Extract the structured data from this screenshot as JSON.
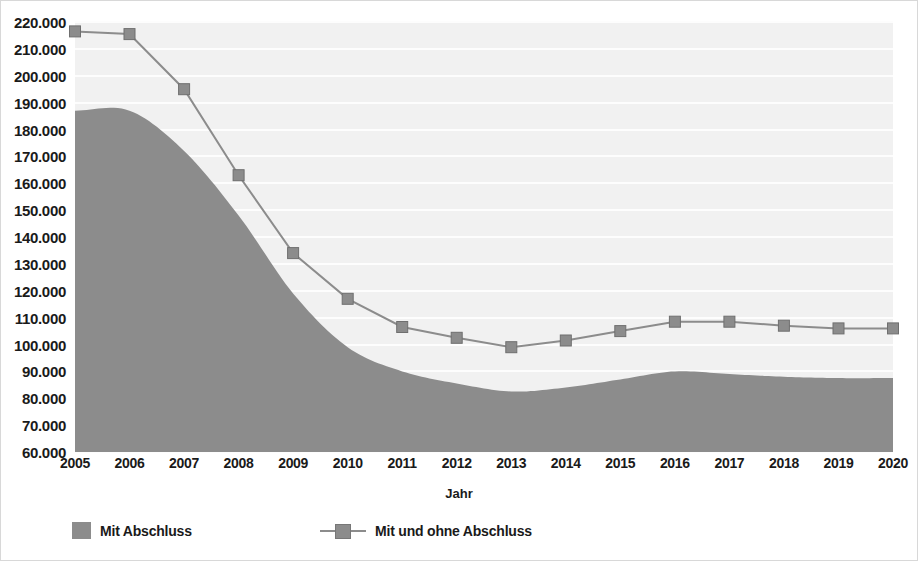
{
  "chart_data": {
    "type": "area",
    "title": "",
    "xlabel": "Jahr",
    "ylabel": "",
    "categories": [
      "2005",
      "2006",
      "2007",
      "2008",
      "2009",
      "2010",
      "2011",
      "2012",
      "2013",
      "2014",
      "2015",
      "2016",
      "2017",
      "2018",
      "2019",
      "2020"
    ],
    "ylim": [
      60000,
      220000
    ],
    "ytick_step": 10000,
    "ytick_labels": [
      "220.000",
      "210.000",
      "200.000",
      "190.000",
      "180.000",
      "170.000",
      "160.000",
      "150.000",
      "140.000",
      "130.000",
      "120.000",
      "110.000",
      "100.000",
      "90.000",
      "80.000",
      "70.000",
      "60.000"
    ],
    "ytick_values": [
      220000,
      210000,
      200000,
      190000,
      180000,
      170000,
      160000,
      150000,
      140000,
      130000,
      120000,
      110000,
      100000,
      90000,
      80000,
      70000,
      60000
    ],
    "grid": true,
    "legend_position": "bottom",
    "series": [
      {
        "name": "Mit Abschluss",
        "type": "area",
        "color": "#8c8c8c",
        "values": [
          187000,
          187000,
          172000,
          148000,
          119000,
          99000,
          90000,
          85500,
          82500,
          84000,
          87000,
          90000,
          89000,
          88000,
          87500,
          87500
        ]
      },
      {
        "name": "Mit und ohne Abschluss",
        "type": "line",
        "color": "#8c8c8c",
        "marker": "square",
        "values": [
          216500,
          215500,
          195000,
          163000,
          134000,
          117000,
          106500,
          102500,
          99000,
          101500,
          105000,
          108500,
          108500,
          107000,
          106000,
          106000
        ]
      }
    ]
  },
  "legend": {
    "items": [
      {
        "label": "Mit Abschluss",
        "marker": "area-swatch"
      },
      {
        "label": "Mit und ohne Abschluss",
        "marker": "line-square-marker"
      }
    ]
  },
  "colors": {
    "plot_background": "#f1f1f1",
    "gridline": "#fdfdfd",
    "series_gray": "#8c8c8c",
    "text": "#1a1a1a"
  }
}
